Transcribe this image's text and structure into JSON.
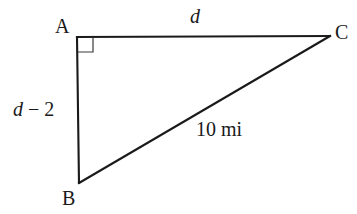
{
  "figure": {
    "type": "right-triangle-diagram",
    "background_color": "#ffffff",
    "stroke_color": "#1a1a1a",
    "vertices": {
      "A": {
        "label": "A",
        "x": 77,
        "y": 37
      },
      "B": {
        "label": "B",
        "x": 79,
        "y": 183
      },
      "C": {
        "label": "C",
        "x": 330,
        "y": 36
      }
    },
    "right_angle": {
      "at_vertex": "A",
      "marker": "right-angle-square",
      "size": 15
    },
    "sides": {
      "AC": {
        "label_italic": "d",
        "label_plain": "",
        "description": "top horizontal leg"
      },
      "AB": {
        "label_italic": "d",
        "label_plain": " − 2",
        "description": "left vertical leg"
      },
      "BC": {
        "label_italic": "",
        "label_plain": "10 mi",
        "description": "hypotenuse"
      }
    }
  }
}
